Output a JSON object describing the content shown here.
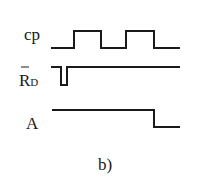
{
  "diagram": {
    "caption": "b)",
    "signals": [
      {
        "name": "cp",
        "label": "cp",
        "points": "51,48 74,48 74,31 101,31 101,48 126,48 126,31 154,31 154,48 180,48"
      },
      {
        "name": "reset",
        "label_main": "R",
        "label_sub": "D",
        "overbar": true,
        "points": "51,67 61,67 61,85 67,85 67,67 180,67"
      },
      {
        "name": "A",
        "label": "A",
        "points": "52,110 154,110 154,127 180,127"
      }
    ]
  }
}
